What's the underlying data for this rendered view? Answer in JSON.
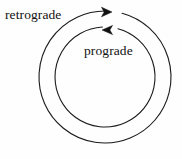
{
  "figure": {
    "background_color": "#fefefe",
    "stroke_color": "#1a1a1a"
  },
  "labels": {
    "retrograde": "retrograde",
    "prograde": "prograde"
  },
  "icons": {
    "outer_arrowhead": "arrow-right-icon",
    "inner_arrowhead": "arrow-left-icon"
  },
  "chart_data": {
    "type": "diagram",
    "title": "",
    "center": {
      "x": 105,
      "y": 77
    },
    "orbits": [
      {
        "name": "retrograde",
        "label": "retrograde",
        "radius": 66,
        "direction": "clockwise",
        "arrow_direction": "right",
        "arrow_tip": {
          "x": 112,
          "y": 12
        },
        "gap_start_deg": 272,
        "gap_end_deg": 285,
        "stroke_width": 1.1,
        "stroke_color": "#1a1a1a"
      },
      {
        "name": "prograde",
        "label": "prograde",
        "radius": 50,
        "direction": "counter-clockwise",
        "arrow_direction": "left",
        "arrow_tip": {
          "x": 102,
          "y": 30
        },
        "gap_start_deg": 267,
        "gap_end_deg": 285,
        "stroke_width": 1.1,
        "stroke_color": "#1a1a1a"
      }
    ],
    "annotations": [
      {
        "text": "retrograde",
        "x": 5,
        "y": 15,
        "anchor": "start"
      },
      {
        "text": "prograde",
        "x": 84,
        "y": 51,
        "anchor": "start"
      }
    ],
    "xlim": [
      0,
      182
    ],
    "ylim": [
      0,
      159
    ],
    "grid": false,
    "legend": "none"
  }
}
